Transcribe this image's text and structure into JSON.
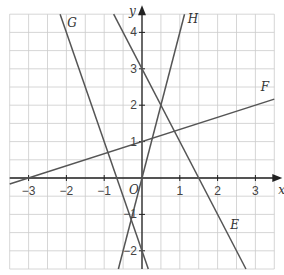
{
  "chart_data": {
    "type": "line",
    "title": "",
    "xlabel": "x",
    "ylabel": "y",
    "origin_label": "O",
    "xlim": [
      -3.5,
      3.5
    ],
    "ylim": [
      -2.5,
      4.5
    ],
    "grid": true,
    "grid_step": 0.5,
    "x_ticks": [
      -3,
      -2,
      -1,
      1,
      2,
      3
    ],
    "x_tick_labels": [
      "−3",
      "−2",
      "−1",
      "1",
      "2",
      "3"
    ],
    "y_ticks": [
      -2,
      -1,
      1,
      2,
      3,
      4
    ],
    "y_tick_labels": [
      "−2",
      "−1",
      "1",
      "2",
      "3",
      "4"
    ],
    "series": [
      {
        "name": "E",
        "equation": "y = -2x + 3",
        "slope": -2,
        "intercept": 3,
        "label_pos": [
          2.45,
          -1.4
        ]
      },
      {
        "name": "F",
        "equation": "y = x/3 + 1",
        "slope": 0.3333,
        "intercept": 1,
        "label_pos": [
          3.25,
          2.4
        ]
      },
      {
        "name": "G",
        "equation": "y = -3x - 2",
        "slope": -3,
        "intercept": -2,
        "label_pos": [
          -1.85,
          4.15
        ]
      },
      {
        "name": "H",
        "equation": "y = 4x",
        "slope": 4,
        "intercept": 0,
        "label_pos": [
          1.35,
          4.25
        ]
      }
    ],
    "colors": {
      "lines": "#555555",
      "axes": "#222222",
      "grid": "#cccccc"
    }
  }
}
